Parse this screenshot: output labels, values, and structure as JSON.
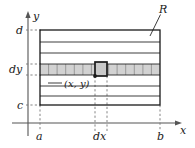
{
  "figure": {
    "type": "math-diagram",
    "colors": {
      "stroke": "#1a1a1a",
      "axis": "#555555",
      "strip_fill": "#d2d2d2",
      "cell_divider": "#8a8a8a",
      "dashed": "#777777",
      "background": "#ffffff"
    },
    "axes": {
      "x_label": "x",
      "y_label": "y",
      "x_axis_y": 123,
      "y_axis_x": 28,
      "arrows": true
    },
    "region": {
      "name_label": "R",
      "left": 40,
      "right": 160,
      "top": 30,
      "bottom": 105
    },
    "tick_labels": {
      "x": [
        {
          "text": "a",
          "at": 40
        },
        {
          "text": "dx",
          "at": 100
        },
        {
          "text": "b",
          "at": 160
        }
      ],
      "y": [
        {
          "text": "d",
          "at": 30
        },
        {
          "text": "dy",
          "at": 69
        },
        {
          "text": "c",
          "at": 105
        }
      ]
    },
    "strip": {
      "top": 64,
      "bottom": 75,
      "cell_count": 14,
      "filled": true
    },
    "band_lines_y": [
      42,
      53,
      64,
      75,
      86,
      96
    ],
    "element": {
      "point_label": "(x, y)",
      "cell_left": 95,
      "cell_right": 107,
      "cell_top": 62,
      "cell_bottom": 76,
      "highlighted": true,
      "point_marker": true
    }
  }
}
